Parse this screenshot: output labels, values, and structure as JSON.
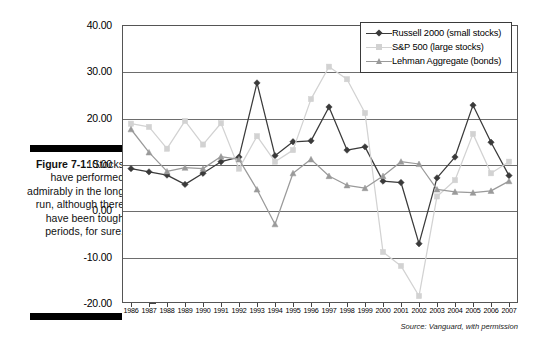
{
  "figure": {
    "number_label": "Figure 7-1:",
    "caption": "Stocks have performed admirably in the long run, although there have been tough periods, for sure.",
    "source_note": "Source: Vanguard, with permission"
  },
  "legend": {
    "position": "top-right",
    "entries": [
      {
        "label": "Russell 2000 (small stocks)",
        "color": "#3a3a3a",
        "marker": "diamond"
      },
      {
        "label": "S&P 500 (large stocks)",
        "color": "#d2d2d2",
        "marker": "square"
      },
      {
        "label": "Lehman Aggregate (bonds)",
        "color": "#9a9a9a",
        "marker": "triangle"
      }
    ]
  },
  "chart_data": {
    "type": "line",
    "title": "",
    "xlabel": "",
    "ylabel": "",
    "ylim": [
      -20,
      40
    ],
    "ytick_values": [
      40,
      30,
      20,
      10,
      0,
      -10,
      -20
    ],
    "ytick_labels": [
      "40.00",
      "30.00",
      "20.00",
      "10.00",
      "0.00",
      "-10.00",
      "-20.00"
    ],
    "grid": true,
    "categories": [
      "1986",
      "1987",
      "1988",
      "1989",
      "1990",
      "1991",
      "1992",
      "1993",
      "1994",
      "1995",
      "1996",
      "1997",
      "1998",
      "1999",
      "2000",
      "2001",
      "2002",
      "2003",
      "2004",
      "2005",
      "2006",
      "2007"
    ],
    "series": [
      {
        "name": "Russell 2000 (small stocks)",
        "color": "#3a3a3a",
        "marker": "diamond",
        "values": [
          9.0,
          8.3,
          7.6,
          5.6,
          8.0,
          10.5,
          11.5,
          27.5,
          11.8,
          14.8,
          15.0,
          22.3,
          13.0,
          13.7,
          6.3,
          6.0,
          -7.2,
          7.0,
          11.5,
          22.7,
          14.7,
          7.5
        ]
      },
      {
        "name": "S&P 500 (large stocks)",
        "color": "#d2d2d2",
        "marker": "square",
        "values": [
          18.7,
          18.0,
          13.3,
          19.3,
          14.2,
          18.8,
          9.0,
          16.0,
          10.5,
          13.0,
          24.0,
          31.0,
          28.3,
          21.0,
          -9.0,
          -12.0,
          -18.5,
          3.0,
          6.5,
          16.5,
          8.0,
          10.5
        ]
      },
      {
        "name": "Lehman Aggregate (bonds)",
        "color": "#9a9a9a",
        "marker": "triangle",
        "values": [
          17.5,
          12.5,
          8.4,
          9.2,
          9.0,
          11.6,
          11.0,
          4.5,
          -3.0,
          8.0,
          11.0,
          7.4,
          5.4,
          4.8,
          7.4,
          10.5,
          10.0,
          4.5,
          4.0,
          3.8,
          4.2,
          6.3
        ]
      }
    ]
  }
}
